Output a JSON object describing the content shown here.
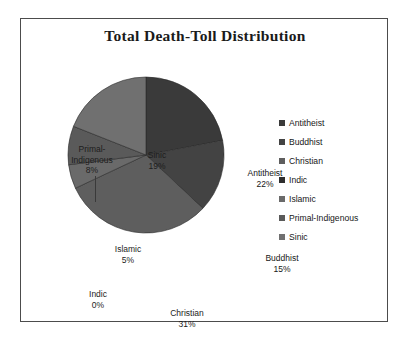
{
  "chart_data": {
    "type": "pie",
    "title": "Total Death-Toll Distribution",
    "xlabel": "",
    "ylabel": "",
    "legend_position": "right",
    "grid": false,
    "categories": [
      "Antitheist",
      "Buddhist",
      "Christian",
      "Indic",
      "Islamic",
      "Primal-Indigenous",
      "Sinic"
    ],
    "values": [
      22,
      15,
      31,
      0,
      5,
      8,
      19
    ],
    "value_unit": "%",
    "slices": [
      {
        "label": "Antitheist",
        "percent": 22,
        "percent_text": "22%",
        "color": "#3a3a3a",
        "label_placement": "inside"
      },
      {
        "label": "Buddhist",
        "percent": 15,
        "percent_text": "15%",
        "color": "#434343",
        "label_placement": "inside"
      },
      {
        "label": "Christian",
        "percent": 31,
        "percent_text": "31%",
        "color": "#5e5e5e",
        "label_placement": "inside"
      },
      {
        "label": "Indic",
        "percent": 0,
        "percent_text": "0%",
        "color": "#2e2e2e",
        "label_placement": "outside"
      },
      {
        "label": "Islamic",
        "percent": 5,
        "percent_text": "5%",
        "color": "#6a6a6a",
        "label_placement": "inside"
      },
      {
        "label": "Primal-Indigenous",
        "percent": 8,
        "percent_text": "8%",
        "color": "#5a5a5a",
        "label_placement": "outside"
      },
      {
        "label": "Sinic",
        "percent": 19,
        "percent_text": "19%",
        "color": "#707070",
        "label_placement": "inside"
      }
    ]
  },
  "title": "Total Death-Toll Distribution",
  "labels": {
    "antitheist_name": "Antitheist",
    "antitheist_pct": "22%",
    "buddhist_name": "Buddhist",
    "buddhist_pct": "15%",
    "christian_name": "Christian",
    "christian_pct": "31%",
    "indic_name": "Indic",
    "indic_pct": "0%",
    "islamic_name": "Islamic",
    "islamic_pct": "5%",
    "primal_name_line1": "Primal-",
    "primal_name_line2": "Indigenous",
    "primal_pct": "8%",
    "sinic_name": "Sinic",
    "sinic_pct": "19%"
  },
  "legend": {
    "items": [
      {
        "label": "Antitheist",
        "color": "#3a3a3a"
      },
      {
        "label": "Buddhist",
        "color": "#434343"
      },
      {
        "label": "Christian",
        "color": "#5e5e5e"
      },
      {
        "label": "Indic",
        "color": "#2e2e2e"
      },
      {
        "label": "Islamic",
        "color": "#6a6a6a"
      },
      {
        "label": "Primal-Indigenous",
        "color": "#5a5a5a"
      },
      {
        "label": "Sinic",
        "color": "#707070"
      }
    ]
  }
}
